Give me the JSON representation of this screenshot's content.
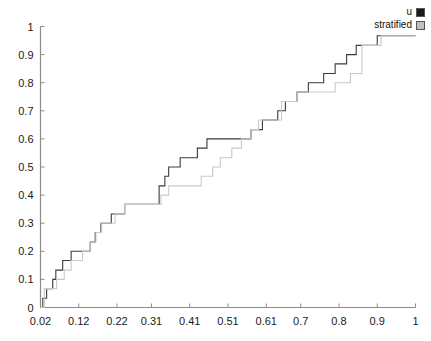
{
  "chart_data": {
    "type": "line",
    "title": "",
    "xlabel": "",
    "ylabel": "",
    "xlim": [
      0.02,
      1.0
    ],
    "ylim": [
      0,
      1
    ],
    "grid": false,
    "legend_position": "top-right",
    "x_tick_labels": [
      "0.02",
      "0.12",
      "0.22",
      "0.31",
      "0.41",
      "0.51",
      "0.61",
      "0.7",
      "0.8",
      "0.9",
      "1"
    ],
    "x_tick_values": [
      0.02,
      0.12,
      0.22,
      0.31,
      0.41,
      0.51,
      0.61,
      0.7,
      0.8,
      0.9,
      1.0
    ],
    "y_tick_labels": [
      "0",
      "0.1",
      "0.2",
      "0.3",
      "0.4",
      "0.5",
      "0.6",
      "0.7",
      "0.8",
      "0.9",
      "1"
    ],
    "y_tick_values": [
      0,
      0.1,
      0.2,
      0.3,
      0.4,
      0.5,
      0.6,
      0.7,
      0.8,
      0.9,
      1.0
    ],
    "step_shape": "hv",
    "series": [
      {
        "name": "u",
        "color": "#3b3b3b",
        "x": [
          0.02,
          0.026,
          0.026,
          0.036,
          0.036,
          0.052,
          0.052,
          0.06,
          0.06,
          0.078,
          0.078,
          0.086,
          0.086,
          0.1,
          0.1,
          0.12,
          0.12,
          0.15,
          0.15,
          0.163,
          0.163,
          0.178,
          0.178,
          0.19,
          0.19,
          0.205,
          0.205,
          0.225,
          0.225,
          0.24,
          0.24,
          0.29,
          0.29,
          0.33,
          0.33,
          0.345,
          0.345,
          0.355,
          0.355,
          0.37,
          0.37,
          0.385,
          0.385,
          0.4,
          0.4,
          0.43,
          0.43,
          0.455,
          0.455,
          0.495,
          0.495,
          0.57,
          0.57,
          0.6,
          0.6,
          0.64,
          0.64,
          0.66,
          0.66,
          0.69,
          0.69,
          0.72,
          0.72,
          0.76,
          0.76,
          0.79,
          0.79,
          0.82,
          0.82,
          0.845,
          0.845,
          0.9,
          0.9,
          0.93,
          0.93,
          1.0
        ],
        "y": [
          0.0,
          0.0,
          0.033,
          0.033,
          0.067,
          0.067,
          0.1,
          0.1,
          0.133,
          0.133,
          0.167,
          0.167,
          0.167,
          0.167,
          0.2,
          0.2,
          0.2,
          0.2,
          0.233,
          0.233,
          0.267,
          0.267,
          0.3,
          0.3,
          0.3,
          0.3,
          0.333,
          0.333,
          0.333,
          0.333,
          0.367,
          0.367,
          0.367,
          0.367,
          0.433,
          0.433,
          0.467,
          0.467,
          0.5,
          0.5,
          0.5,
          0.5,
          0.533,
          0.533,
          0.533,
          0.533,
          0.567,
          0.567,
          0.6,
          0.6,
          0.6,
          0.6,
          0.633,
          0.633,
          0.667,
          0.667,
          0.7,
          0.7,
          0.733,
          0.733,
          0.767,
          0.767,
          0.8,
          0.8,
          0.833,
          0.833,
          0.867,
          0.867,
          0.9,
          0.9,
          0.933,
          0.933,
          0.967,
          0.967,
          0.967,
          0.967
        ]
      },
      {
        "name": "stratified",
        "color": "#c9c9c9",
        "x": [
          0.02,
          0.03,
          0.03,
          0.048,
          0.048,
          0.062,
          0.062,
          0.082,
          0.082,
          0.1,
          0.1,
          0.115,
          0.115,
          0.13,
          0.13,
          0.15,
          0.15,
          0.165,
          0.165,
          0.18,
          0.18,
          0.195,
          0.195,
          0.215,
          0.215,
          0.24,
          0.24,
          0.3,
          0.3,
          0.335,
          0.335,
          0.355,
          0.355,
          0.375,
          0.375,
          0.4,
          0.4,
          0.44,
          0.44,
          0.47,
          0.47,
          0.49,
          0.49,
          0.52,
          0.52,
          0.545,
          0.545,
          0.57,
          0.57,
          0.59,
          0.59,
          0.62,
          0.62,
          0.65,
          0.65,
          0.69,
          0.69,
          0.79,
          0.79,
          0.83,
          0.83,
          0.86,
          0.86,
          0.91,
          0.91,
          1.0
        ],
        "y": [
          0.0,
          0.0,
          0.067,
          0.067,
          0.067,
          0.067,
          0.1,
          0.1,
          0.133,
          0.133,
          0.167,
          0.167,
          0.167,
          0.167,
          0.2,
          0.2,
          0.233,
          0.233,
          0.267,
          0.267,
          0.3,
          0.3,
          0.3,
          0.3,
          0.333,
          0.333,
          0.367,
          0.367,
          0.367,
          0.367,
          0.4,
          0.4,
          0.433,
          0.433,
          0.433,
          0.433,
          0.433,
          0.433,
          0.467,
          0.467,
          0.5,
          0.5,
          0.533,
          0.533,
          0.567,
          0.567,
          0.6,
          0.6,
          0.633,
          0.633,
          0.667,
          0.667,
          0.667,
          0.667,
          0.733,
          0.733,
          0.767,
          0.767,
          0.8,
          0.8,
          0.833,
          0.833,
          0.933,
          0.933,
          0.967,
          0.967
        ]
      }
    ]
  },
  "legend": {
    "items": [
      {
        "label": "u",
        "color": "#1a1a1a"
      },
      {
        "label": "stratified",
        "color": "#bfbfbf"
      }
    ]
  },
  "axes": {
    "axis_color": "#8c8c8c",
    "tick_color": "#8c8c8c",
    "label_color": "#1a1a1a"
  }
}
